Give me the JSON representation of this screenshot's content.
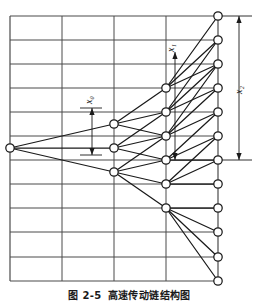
{
  "figure": {
    "caption_label": "图 2-5",
    "caption_title": "高速传动链结构图",
    "background_color": "#ffffff",
    "grid_color": "#4a4a4a",
    "tree_color": "#1a1a1a",
    "node_fill": "#ffffff"
  },
  "annotations": {
    "x0": {
      "label": "x₀",
      "text_x": 90,
      "text_y": 100,
      "arrow_x": 92,
      "arrow_top": 108,
      "arrow_bottom": 155
    },
    "x1": {
      "label": "x₁",
      "text_x": 172,
      "text_y": 48,
      "arrow_x": 175,
      "arrow_top": 52,
      "arrow_bottom": 160
    },
    "x2": {
      "label": "x₂",
      "text_x": 240,
      "text_y": 90,
      "arrow_x": 239,
      "arrow_top": 16,
      "arrow_bottom": 160
    }
  },
  "grid": {
    "x_left": 10,
    "x_right": 218,
    "y_top": 16,
    "y_bottom": 281,
    "vertical_lines": [
      10,
      62,
      114,
      166,
      218
    ],
    "horizontal_lines": [
      16,
      40,
      64,
      88,
      112,
      136,
      160,
      184,
      208,
      232,
      257,
      281
    ]
  },
  "reference_lines": {
    "top_y": 16,
    "mid_y": 160,
    "x_start": 218,
    "x_end": 252
  },
  "chart_data": {
    "type": "diagram",
    "title": "高速传动链结构图",
    "subtype": "trellis-lattice-tree",
    "stage_x": [
      10,
      114,
      166,
      218
    ],
    "node_radius": 4.2,
    "stages": [
      {
        "stage": 0,
        "x": 10,
        "nodes": [
          {
            "id": "n0",
            "y": 148
          }
        ]
      },
      {
        "stage": 1,
        "x": 114,
        "nodes": [
          {
            "id": "n1a",
            "y": 124
          },
          {
            "id": "n1b",
            "y": 148
          },
          {
            "id": "n1c",
            "y": 172
          }
        ]
      },
      {
        "stage": 2,
        "x": 166,
        "nodes": [
          {
            "id": "n2a",
            "y": 88
          },
          {
            "id": "n2b",
            "y": 112
          },
          {
            "id": "n2c",
            "y": 136
          },
          {
            "id": "n2d",
            "y": 160
          },
          {
            "id": "n2e",
            "y": 184
          },
          {
            "id": "n2f",
            "y": 208
          }
        ]
      },
      {
        "stage": 3,
        "x": 218,
        "nodes": [
          {
            "id": "n3a",
            "y": 16
          },
          {
            "id": "n3b",
            "y": 40
          },
          {
            "id": "n3c",
            "y": 64
          },
          {
            "id": "n3d",
            "y": 88
          },
          {
            "id": "n3e",
            "y": 112
          },
          {
            "id": "n3f",
            "y": 136
          },
          {
            "id": "n3g",
            "y": 160
          },
          {
            "id": "n3h",
            "y": 184
          },
          {
            "id": "n3i",
            "y": 208
          },
          {
            "id": "n3j",
            "y": 232
          },
          {
            "id": "n3k",
            "y": 257
          },
          {
            "id": "n3l",
            "y": 281
          }
        ]
      }
    ],
    "edges": [
      [
        "n0",
        "n1a"
      ],
      [
        "n0",
        "n1b"
      ],
      [
        "n0",
        "n1c"
      ],
      [
        "n1a",
        "n2a"
      ],
      [
        "n1a",
        "n2b"
      ],
      [
        "n1a",
        "n2c"
      ],
      [
        "n1b",
        "n2b"
      ],
      [
        "n1b",
        "n2c"
      ],
      [
        "n1b",
        "n2d"
      ],
      [
        "n1c",
        "n2c"
      ],
      [
        "n1c",
        "n2d"
      ],
      [
        "n1c",
        "n2e"
      ],
      [
        "n1c",
        "n2f"
      ],
      [
        "n2a",
        "n3a"
      ],
      [
        "n2a",
        "n3b"
      ],
      [
        "n2a",
        "n3c"
      ],
      [
        "n2b",
        "n3b"
      ],
      [
        "n2b",
        "n3c"
      ],
      [
        "n2b",
        "n3d"
      ],
      [
        "n2c",
        "n3c"
      ],
      [
        "n2c",
        "n3d"
      ],
      [
        "n2c",
        "n3e"
      ],
      [
        "n2d",
        "n3e"
      ],
      [
        "n2d",
        "n3f"
      ],
      [
        "n2d",
        "n3g"
      ],
      [
        "n2e",
        "n3f"
      ],
      [
        "n2e",
        "n3g"
      ],
      [
        "n2e",
        "n3h"
      ],
      [
        "n2f",
        "n3i"
      ],
      [
        "n2f",
        "n3j"
      ],
      [
        "n2f",
        "n3k"
      ],
      [
        "n2f",
        "n3l"
      ]
    ]
  }
}
